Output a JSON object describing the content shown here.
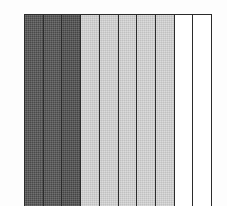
{
  "figure": {
    "background_color": "#fdfdfd",
    "frame_color": "#2b2b2b",
    "title": "",
    "subtitle": ""
  },
  "chart_data": {
    "type": "bar",
    "title": "",
    "subtitle": "",
    "xlabel": "",
    "ylabel": "",
    "categories": [
      "1",
      "2",
      "3",
      "4",
      "5",
      "6",
      "7",
      "8",
      "9",
      "10"
    ],
    "values": [
      100,
      100,
      100,
      100,
      100,
      100,
      100,
      100,
      100,
      100
    ],
    "ylim": [
      0,
      100
    ],
    "xtick_labels": [],
    "ytick_labels": [],
    "grid": false,
    "legend": [],
    "legend_position": "none",
    "annotations": [],
    "orientation": "vertical",
    "bar_count": 10,
    "bar_edge_color": "#2b2b2b",
    "bar_fill_colors": [
      "#4f4f4f",
      "#4f4f4f",
      "#4a4a4a",
      "#d2d2d2",
      "#d2d2d2",
      "#d2d2d2",
      "#d2d2d2",
      "#d2d2d2",
      "#ffffff",
      "#ffffff"
    ],
    "bars": [
      {
        "index": 1,
        "label": "1",
        "value": 100,
        "fill": "#4f4f4f",
        "shade": "dark",
        "textured": true
      },
      {
        "index": 2,
        "label": "2",
        "value": 100,
        "fill": "#4f4f4f",
        "shade": "dark",
        "textured": true
      },
      {
        "index": 3,
        "label": "3",
        "value": 100,
        "fill": "#4a4a4a",
        "shade": "dark",
        "textured": true
      },
      {
        "index": 4,
        "label": "4",
        "value": 100,
        "fill": "#d2d2d2",
        "shade": "light",
        "textured": true
      },
      {
        "index": 5,
        "label": "5",
        "value": 100,
        "fill": "#d2d2d2",
        "shade": "light",
        "textured": true
      },
      {
        "index": 6,
        "label": "6",
        "value": 100,
        "fill": "#d2d2d2",
        "shade": "light",
        "textured": true
      },
      {
        "index": 7,
        "label": "7",
        "value": 100,
        "fill": "#d2d2d2",
        "shade": "light",
        "textured": true
      },
      {
        "index": 8,
        "label": "8",
        "value": 100,
        "fill": "#d2d2d2",
        "shade": "light",
        "textured": true
      },
      {
        "index": 9,
        "label": "9",
        "value": 100,
        "fill": "#ffffff",
        "shade": "white",
        "textured": false
      },
      {
        "index": 10,
        "label": "10",
        "value": 100,
        "fill": "#ffffff",
        "shade": "white",
        "textured": false
      }
    ]
  }
}
